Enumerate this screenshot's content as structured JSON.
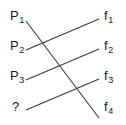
{
  "diagram": {
    "background_color": "#ffffff",
    "line_color": "#3a3a3a",
    "text_color": "#1a1a1a",
    "left_nodes": [
      {
        "id": "p1",
        "base": "P",
        "sub": "1",
        "label": "P1",
        "x": 10,
        "y": 9
      },
      {
        "id": "p2",
        "base": "P",
        "sub": "2",
        "label": "P2",
        "x": 10,
        "y": 39
      },
      {
        "id": "p3",
        "base": "P",
        "sub": "3",
        "label": "P3",
        "x": 10,
        "y": 69
      },
      {
        "id": "unknown",
        "base": "?",
        "sub": "",
        "label": "?",
        "x": 12,
        "y": 100
      }
    ],
    "right_nodes": [
      {
        "id": "f1",
        "base": "f",
        "sub": "1",
        "label": "f1",
        "x": 104,
        "y": 9
      },
      {
        "id": "f2",
        "base": "f",
        "sub": "2",
        "label": "f2",
        "x": 104,
        "y": 39
      },
      {
        "id": "f3",
        "base": "f",
        "sub": "3",
        "label": "f3",
        "x": 104,
        "y": 69
      },
      {
        "id": "f4",
        "base": "f",
        "sub": "4",
        "label": "f4",
        "x": 104,
        "y": 100
      }
    ],
    "edges": [
      {
        "id": "edge-p1-f4",
        "from": "p1",
        "to": "f4",
        "x1": 26,
        "y1": 21,
        "x2": 99,
        "y2": 118
      },
      {
        "id": "edge-p2-f1",
        "from": "p2",
        "to": "f1",
        "x1": 26,
        "y1": 50,
        "x2": 99,
        "y2": 19
      },
      {
        "id": "edge-p3-f2",
        "from": "p3",
        "to": "f2",
        "x1": 26,
        "y1": 80,
        "x2": 99,
        "y2": 49
      },
      {
        "id": "edge-unknown-f3",
        "from": "unknown",
        "to": "f3",
        "x1": 26,
        "y1": 110,
        "x2": 99,
        "y2": 79
      }
    ],
    "crossings": [
      {
        "id": "crossing-1",
        "x": 40,
        "y": 40,
        "edges": [
          "edge-p1-f4",
          "edge-p2-f1"
        ]
      },
      {
        "id": "crossing-2",
        "x": 59,
        "y": 67,
        "edges": [
          "edge-p1-f4",
          "edge-p3-f2"
        ]
      },
      {
        "id": "crossing-3",
        "x": 76,
        "y": 92,
        "edges": [
          "edge-p1-f4",
          "edge-unknown-f3"
        ]
      }
    ]
  }
}
